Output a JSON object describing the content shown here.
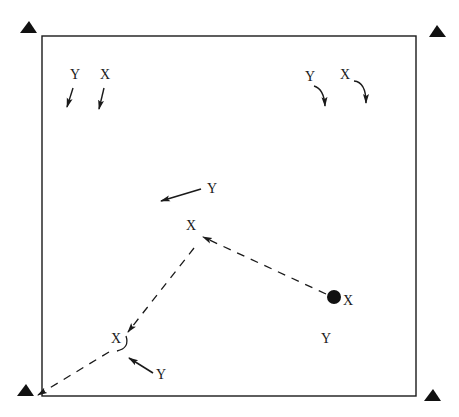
{
  "diagram": {
    "colors": {
      "ink": "#1a1a1a",
      "background": "#ffffff"
    },
    "frame": {
      "x1": 42,
      "y1": 36,
      "x2": 416,
      "y2": 396
    },
    "corner_markers": [
      {
        "id": "top-left",
        "shape": "triangle",
        "x": 29,
        "y": 28
      },
      {
        "id": "top-right",
        "shape": "triangle",
        "x": 437,
        "y": 31
      },
      {
        "id": "bottom-left",
        "shape": "triangle",
        "x": 26,
        "y": 389
      },
      {
        "id": "bottom-right",
        "shape": "triangle",
        "x": 433,
        "y": 393
      }
    ],
    "labels": {
      "tl_y": "Y",
      "tl_x": "X",
      "tr_y": "Y",
      "tr_x": "X",
      "mid_y": "Y",
      "mid_x": "X",
      "dot_x": "X",
      "lower_y": "Y",
      "left_x": "X",
      "left_y": "Y"
    },
    "start_point": {
      "shape": "filled-circle",
      "x": 334,
      "y": 297,
      "label": "X"
    },
    "paths": [
      {
        "id": "path-1",
        "style": "dashed",
        "from": [
          334,
          297
        ],
        "to": [
          203,
          238
        ],
        "arrow": "end"
      },
      {
        "id": "path-2",
        "style": "dashed",
        "from": [
          194,
          250
        ],
        "to": [
          128,
          330
        ],
        "arrow": "end"
      },
      {
        "id": "path-3",
        "style": "dashed",
        "from": [
          110,
          350
        ],
        "to": [
          37,
          394
        ],
        "arrow": "end"
      }
    ]
  }
}
